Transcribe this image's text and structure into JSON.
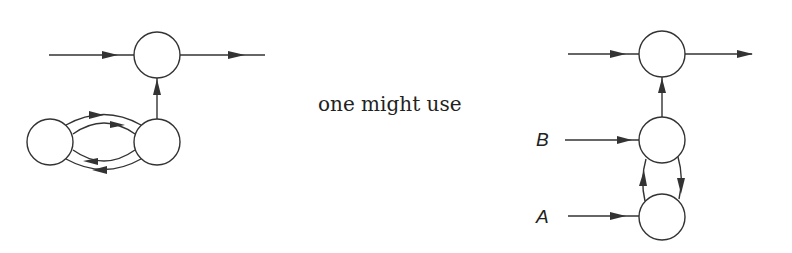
{
  "caption": "one might use",
  "labels": {
    "b": "B",
    "a": "A"
  },
  "colors": {
    "stroke": "#333333",
    "background": "#ffffff"
  },
  "diagrams": {
    "left": {
      "description": "original network: input to top node, output from top node; two lower nodes connected by two pairs of opposing arcs, lower-right node feeds top node",
      "nodes": [
        {
          "id": "top",
          "cx": 157,
          "cy": 55
        },
        {
          "id": "lower-left",
          "cx": 50,
          "cy": 142
        },
        {
          "id": "lower-right",
          "cx": 157,
          "cy": 142
        }
      ]
    },
    "right": {
      "description": "alternative chain: top node with input and output; middle node with input B feeds top; bottom node with input A; mutual arcs between middle and bottom",
      "nodes": [
        {
          "id": "top",
          "cx": 662,
          "cy": 54
        },
        {
          "id": "middle",
          "cx": 662,
          "cy": 140
        },
        {
          "id": "bottom",
          "cx": 662,
          "cy": 217
        }
      ]
    }
  }
}
